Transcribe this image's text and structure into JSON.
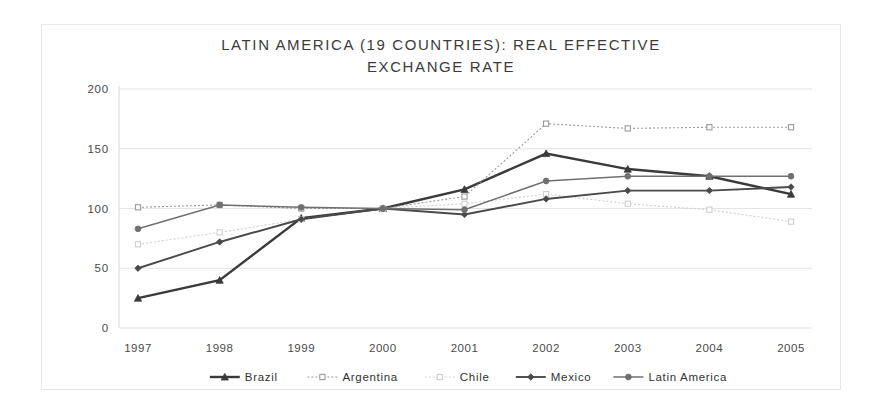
{
  "chart_data": {
    "type": "line",
    "title": "LATIN AMERICA (19 COUNTRIES): REAL EFFECTIVE\nEXCHANGE RATE",
    "xlabel": "",
    "ylabel": "",
    "x": [
      "1997",
      "1998",
      "1999",
      "2000",
      "2001",
      "2002",
      "2003",
      "2004",
      "2005"
    ],
    "categories": [
      "1997",
      "1998",
      "1999",
      "2000",
      "2001",
      "2002",
      "2003",
      "2004",
      "2005"
    ],
    "ylim": [
      0,
      200
    ],
    "yticks": [
      0,
      50,
      100,
      150,
      200
    ],
    "ytick_labels": [
      "0",
      "50",
      "100",
      "150",
      "200"
    ],
    "grid": true,
    "legend_position": "bottom",
    "series": [
      {
        "name": "Brazil",
        "values": [
          25,
          40,
          92,
          100,
          116,
          146,
          133,
          127,
          112
        ],
        "color": "#3a3a3a",
        "width": 2.4,
        "dash": "none",
        "marker": "triangle"
      },
      {
        "name": "Argentina",
        "values": [
          101,
          103,
          100,
          100,
          110,
          171,
          167,
          168,
          168
        ],
        "color": "#9a9a9a",
        "width": 1.1,
        "dash": "2,2",
        "marker": "square"
      },
      {
        "name": "Chile",
        "values": [
          70,
          80,
          91,
          100,
          104,
          112,
          104,
          99,
          89
        ],
        "color": "#cfcfcf",
        "width": 1.1,
        "dash": "2,2",
        "marker": "square"
      },
      {
        "name": "Mexico",
        "values": [
          50,
          72,
          91,
          100,
          95,
          108,
          115,
          115,
          118
        ],
        "color": "#4a4a4a",
        "width": 1.9,
        "dash": "none",
        "marker": "diamond"
      },
      {
        "name": "Latin America",
        "values": [
          83,
          103,
          101,
          100,
          99,
          123,
          127,
          127,
          127
        ],
        "color": "#707070",
        "width": 1.5,
        "dash": "none",
        "marker": "circle"
      }
    ],
    "legend": [
      {
        "label": "Brazil",
        "color": "#3a3a3a",
        "marker": "triangle",
        "width": 2.4,
        "dash": "none"
      },
      {
        "label": "Argentina",
        "color": "#9a9a9a",
        "marker": "square",
        "width": 1.1,
        "dash": "2,2"
      },
      {
        "label": "Chile",
        "color": "#cfcfcf",
        "marker": "square",
        "width": 1.1,
        "dash": "2,2"
      },
      {
        "label": "Mexico",
        "color": "#4a4a4a",
        "marker": "diamond",
        "width": 1.9,
        "dash": "none"
      },
      {
        "label": "Latin America",
        "color": "#707070",
        "marker": "circle",
        "width": 1.5,
        "dash": "none"
      }
    ]
  }
}
